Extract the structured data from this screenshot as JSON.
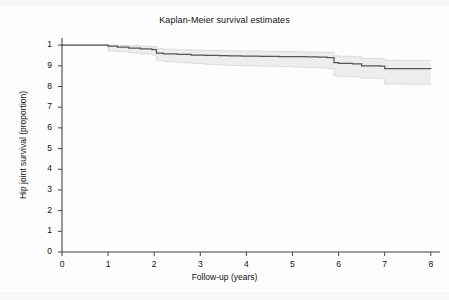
{
  "chart_data": {
    "type": "line",
    "title": "Kaplan-Meier survival estimates",
    "xlabel": "Follow-up (years)",
    "ylabel": "Hip joint survival (proportion)",
    "xlim": [
      0,
      8.2
    ],
    "ylim": [
      0,
      1.02
    ],
    "grid": false,
    "legend": "none",
    "xticks": [
      "0",
      "1",
      "2",
      "3",
      "4",
      "5",
      "6",
      "7",
      "8"
    ],
    "xtick_values": [
      0,
      1,
      2,
      3,
      4,
      5,
      6,
      7,
      8
    ],
    "yticks": [
      "0",
      "1",
      "2",
      "3",
      "4",
      "5",
      "6",
      "7",
      "8",
      "9",
      "1"
    ],
    "ytick_values": [
      0,
      0.1,
      0.2,
      0.3,
      0.4,
      0.5,
      0.6,
      0.7,
      0.8,
      0.9,
      1.0
    ],
    "series": [
      {
        "name": "Survival function",
        "style": "step",
        "color": "#555555",
        "x": [
          0,
          0.8,
          1.0,
          1.2,
          1.45,
          1.7,
          1.95,
          2.05,
          2.2,
          2.5,
          2.8,
          3.1,
          3.4,
          3.6,
          3.9,
          4.3,
          4.7,
          5.0,
          5.3,
          5.55,
          5.75,
          5.9,
          6.0,
          6.3,
          6.5,
          6.9,
          7.0,
          7.4,
          8.0
        ],
        "y": [
          1.0,
          1.0,
          0.995,
          0.99,
          0.985,
          0.982,
          0.978,
          0.962,
          0.958,
          0.955,
          0.952,
          0.95,
          0.949,
          0.948,
          0.947,
          0.946,
          0.945,
          0.944,
          0.943,
          0.942,
          0.94,
          0.915,
          0.912,
          0.91,
          0.9,
          0.898,
          0.887,
          0.886,
          0.885
        ]
      },
      {
        "name": "95% CI upper",
        "style": "step",
        "color": "#e9e9e9",
        "x": [
          0,
          0.8,
          1.0,
          1.2,
          1.45,
          1.7,
          1.95,
          2.05,
          2.2,
          2.5,
          2.8,
          3.1,
          3.4,
          3.6,
          3.9,
          4.3,
          4.7,
          5.0,
          5.3,
          5.55,
          5.75,
          5.9,
          6.0,
          6.3,
          6.5,
          6.9,
          7.0,
          7.4,
          8.0
        ],
        "y": [
          1.0,
          1.0,
          1.0,
          0.999,
          0.997,
          0.995,
          0.993,
          0.983,
          0.98,
          0.978,
          0.976,
          0.974,
          0.973,
          0.972,
          0.971,
          0.97,
          0.969,
          0.968,
          0.967,
          0.966,
          0.964,
          0.948,
          0.946,
          0.944,
          0.936,
          0.934,
          0.927,
          0.926,
          0.925
        ]
      },
      {
        "name": "95% CI lower",
        "style": "step",
        "color": "#e9e9e9",
        "x": [
          0,
          0.8,
          1.0,
          1.2,
          1.45,
          1.7,
          1.95,
          2.05,
          2.2,
          2.5,
          2.8,
          3.1,
          3.4,
          3.6,
          3.9,
          4.3,
          4.7,
          5.0,
          5.3,
          5.55,
          5.75,
          5.9,
          6.0,
          6.3,
          6.5,
          6.9,
          7.0,
          7.4,
          8.0
        ],
        "y": [
          1.0,
          1.0,
          0.972,
          0.968,
          0.963,
          0.958,
          0.952,
          0.925,
          0.92,
          0.915,
          0.911,
          0.907,
          0.904,
          0.902,
          0.9,
          0.898,
          0.896,
          0.894,
          0.892,
          0.89,
          0.886,
          0.852,
          0.849,
          0.846,
          0.84,
          0.838,
          0.812,
          0.811,
          0.81
        ]
      }
    ],
    "band": {
      "name": "95% confidence interval",
      "fill": "#ededed",
      "edge": "#d8d8d8"
    },
    "axis_color": "#444444",
    "geometry": {
      "plot_left": 62,
      "plot_right": 440,
      "plot_top": 41,
      "plot_bottom": 252
    }
  }
}
